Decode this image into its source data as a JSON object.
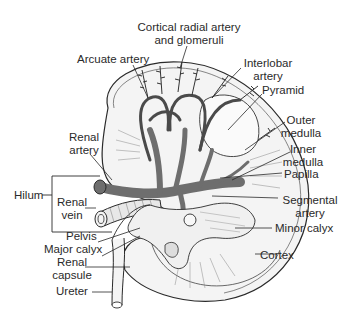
{
  "figure": {
    "colors": {
      "background": "#ffffff",
      "ink": "#2a2a2a",
      "vessel_fill": "#6e6e6e",
      "vessel_dark": "#4a4a4a",
      "kidney_fill": "#f4f4f4"
    }
  },
  "labels": {
    "cortical_radial": "Cortical radial artery\nand glomeruli",
    "arcuate_artery": "Arcuate artery",
    "interlobar_artery": "Interlobar\nartery",
    "pyramid": "Pyramid",
    "outer_medulla": "Outer\nmedulla",
    "inner_medulla": "Inner\nmedulla",
    "papilla": "Papilla",
    "segmental_artery": "Segmental\nartery",
    "minor_calyx": "Minor calyx",
    "cortex": "Cortex",
    "renal_artery": "Renal\nartery",
    "hilum": "Hilum",
    "renal_vein": "Renal\nvein",
    "pelvis": "Pelvis",
    "major_calyx": "Major calyx",
    "renal_capsule": "Renal\ncapsule",
    "ureter": "Ureter"
  }
}
